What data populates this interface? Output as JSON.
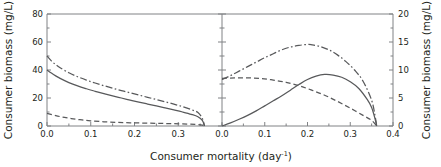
{
  "figure": {
    "name": "consumer-biomass-vs-mortality",
    "xlabel": "Consumer mortality (day",
    "xlabel_sup": "-1",
    "xlabel_tail": ")",
    "ylabel_left": "Consumer biomass (mg/L)",
    "ylabel_right": "Consumer biomass (mg/L)",
    "line_color": "#58595b",
    "axis_color": "#808285",
    "background": "#ffffff"
  },
  "chart_data": [
    {
      "type": "line",
      "panel": "left",
      "title": "",
      "xlabel": "Consumer mortality (day-1)",
      "ylabel": "Consumer biomass (mg/L)",
      "xlim": [
        0.0,
        0.4
      ],
      "ylim": [
        0,
        80
      ],
      "xticks": [
        0.0,
        0.1,
        0.2,
        0.3
      ],
      "xtick_labels": [
        "0.0",
        "0.1",
        "0.2",
        "0.3"
      ],
      "yticks": [
        0,
        20,
        40,
        60,
        80
      ],
      "ytick_labels": [
        "0",
        "20",
        "40",
        "60",
        "80"
      ],
      "yminor": [
        10,
        30,
        50,
        70
      ],
      "grid": false,
      "legend": false,
      "series": [
        {
          "name": "solid",
          "style": "solid",
          "x": [
            0.0,
            0.01,
            0.02,
            0.03,
            0.05,
            0.07,
            0.09,
            0.11,
            0.13,
            0.15,
            0.17,
            0.19,
            0.21,
            0.23,
            0.25,
            0.27,
            0.29,
            0.31,
            0.33,
            0.345,
            0.355,
            0.36
          ],
          "values": [
            40.0,
            37.8,
            35.8,
            34.0,
            31.0,
            28.6,
            26.6,
            24.8,
            23.1,
            21.5,
            20.0,
            18.5,
            17.1,
            15.7,
            14.3,
            12.9,
            11.5,
            10.0,
            8.3,
            6.6,
            4.0,
            0.0
          ]
        },
        {
          "name": "dash-dot",
          "style": "dashdot",
          "x": [
            0.0,
            0.01,
            0.02,
            0.03,
            0.05,
            0.07,
            0.09,
            0.11,
            0.13,
            0.15,
            0.17,
            0.19,
            0.21,
            0.23,
            0.25,
            0.27,
            0.29,
            0.31,
            0.33,
            0.345,
            0.355,
            0.36
          ],
          "values": [
            50.0,
            46.5,
            43.8,
            41.6,
            38.0,
            35.2,
            32.8,
            30.7,
            28.8,
            27.0,
            25.3,
            23.7,
            22.1,
            20.5,
            18.9,
            17.3,
            15.6,
            13.8,
            11.7,
            9.6,
            5.5,
            0.0
          ]
        },
        {
          "name": "dashed",
          "style": "dashed",
          "x": [
            0.0,
            0.02,
            0.04,
            0.06,
            0.08,
            0.1,
            0.13,
            0.16,
            0.19,
            0.22,
            0.25,
            0.28,
            0.31,
            0.34,
            0.355,
            0.36
          ],
          "values": [
            9.0,
            7.4,
            6.1,
            5.1,
            4.3,
            3.7,
            3.0,
            2.6,
            2.3,
            2.1,
            1.9,
            1.7,
            1.5,
            1.2,
            0.7,
            0.0
          ]
        }
      ]
    },
    {
      "type": "line",
      "panel": "right",
      "title": "",
      "xlabel": "Consumer mortality (day-1)",
      "ylabel": "Consumer biomass (mg/L)",
      "xlim": [
        0.0,
        0.4
      ],
      "ylim": [
        0,
        20
      ],
      "xticks": [
        0.0,
        0.1,
        0.2,
        0.3,
        0.4
      ],
      "xtick_labels": [
        "0.0",
        "0.1",
        "0.2",
        "0.3",
        "0.4"
      ],
      "yticks": [
        0,
        5,
        10,
        15,
        20
      ],
      "ytick_labels": [
        "0",
        "5",
        "10",
        "15",
        "20"
      ],
      "yminor": [
        2.5,
        7.5,
        12.5,
        17.5
      ],
      "grid": false,
      "legend": false,
      "series": [
        {
          "name": "solid",
          "style": "solid",
          "x": [
            0.0,
            0.02,
            0.04,
            0.06,
            0.08,
            0.1,
            0.12,
            0.14,
            0.16,
            0.18,
            0.2,
            0.22,
            0.24,
            0.26,
            0.28,
            0.3,
            0.32,
            0.34,
            0.35,
            0.358,
            0.362
          ],
          "values": [
            0.0,
            0.55,
            1.2,
            1.9,
            2.7,
            3.6,
            4.5,
            5.4,
            6.4,
            7.4,
            8.3,
            8.9,
            9.2,
            9.1,
            8.7,
            7.9,
            6.7,
            4.7,
            3.3,
            1.3,
            0.0
          ]
        },
        {
          "name": "dashed",
          "style": "dashed",
          "x": [
            0.0,
            0.03,
            0.06,
            0.09,
            0.12,
            0.15,
            0.18,
            0.21,
            0.24,
            0.27,
            0.3,
            0.33,
            0.35,
            0.362
          ],
          "values": [
            8.5,
            8.6,
            8.6,
            8.5,
            8.2,
            7.8,
            7.2,
            6.4,
            5.5,
            4.4,
            3.2,
            1.9,
            1.0,
            0.0
          ]
        },
        {
          "name": "dash-dot",
          "style": "dashdot",
          "x": [
            0.0,
            0.02,
            0.04,
            0.06,
            0.08,
            0.1,
            0.12,
            0.14,
            0.16,
            0.18,
            0.2,
            0.21,
            0.23,
            0.25,
            0.27,
            0.29,
            0.31,
            0.33,
            0.35,
            0.358,
            0.362
          ],
          "values": [
            8.3,
            9.0,
            9.8,
            10.6,
            11.4,
            12.2,
            12.9,
            13.6,
            14.1,
            14.4,
            14.55,
            14.5,
            14.2,
            13.6,
            12.7,
            11.5,
            10.0,
            8.0,
            4.6,
            1.8,
            0.0
          ]
        }
      ]
    }
  ]
}
